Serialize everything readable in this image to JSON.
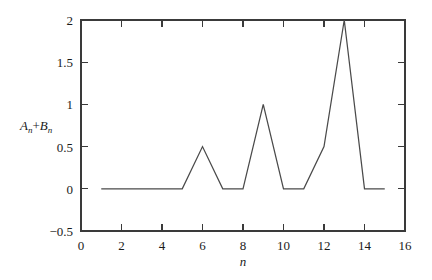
{
  "chart_data": {
    "type": "line",
    "title": "",
    "subtitle": "",
    "xlabel": "n",
    "ylabel": "A_n+B_n",
    "ylabel_parts": [
      {
        "text": "A",
        "style": "italic"
      },
      {
        "text": "n",
        "style": "subscript"
      },
      {
        "text": "+",
        "style": "normal"
      },
      {
        "text": "B",
        "style": "italic"
      },
      {
        "text": "n",
        "style": "subscript"
      }
    ],
    "xlim": [
      0,
      16
    ],
    "ylim": [
      -0.5,
      2
    ],
    "xticks": [
      0,
      2,
      4,
      6,
      8,
      10,
      12,
      14,
      16
    ],
    "xtick_labels": [
      "0",
      "2",
      "4",
      "6",
      "8",
      "10",
      "12",
      "14",
      "16"
    ],
    "yticks": [
      -0.5,
      0,
      0.5,
      1,
      1.5,
      2
    ],
    "ytick_labels": [
      "−0.5",
      "0",
      "0.5",
      "1",
      "1.5",
      "2"
    ],
    "grid": false,
    "legend": false,
    "legend_position": "none",
    "line_color": "#4a4a4a",
    "axis_color": "#3a3a3a",
    "background_color": "#ffffff",
    "x": [
      1,
      2,
      3,
      4,
      5,
      6,
      7,
      8,
      9,
      10,
      11,
      12,
      13,
      14,
      15
    ],
    "values": [
      0,
      0,
      0,
      0,
      0,
      0.5,
      0,
      0,
      1,
      0,
      0,
      0.5,
      2,
      0,
      0
    ],
    "series": [
      {
        "name": "A_n+B_n",
        "values": [
          0,
          0,
          0,
          0,
          0,
          0.5,
          0,
          0,
          1,
          0,
          0,
          0.5,
          2,
          0,
          0
        ]
      }
    ],
    "annotations": []
  }
}
